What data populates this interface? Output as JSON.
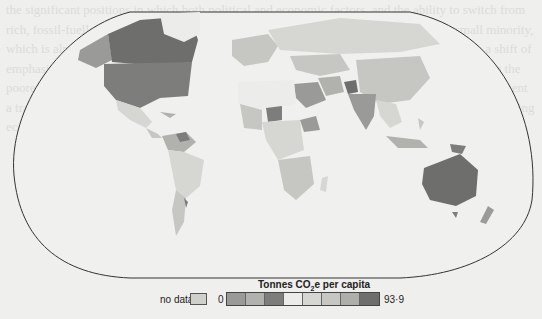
{
  "map": {
    "title": "Tonnes CO2e per capita",
    "title_main": "Tonnes CO",
    "title_sub": "2",
    "title_rest": "e per capita",
    "type": "choropleth world map",
    "projection": "pseudo-elliptical (Robinson-like) with flattened poles"
  },
  "legend": {
    "no_data_label": "no data",
    "no_data_color": "#cfcfcc",
    "min_label": "0",
    "max_label": "93·9",
    "swatches": [
      "#9a9a98",
      "#b1b1ae",
      "#7d7d7b",
      "#ececea",
      "#d6d6d3",
      "#c6c6c3",
      "#aeaeab",
      "#6e6e6c"
    ]
  },
  "regions": {
    "north_america": {
      "usa": "#7d7d7b",
      "canada": "#6e6e6c",
      "alaska": "#9a9a98",
      "mexico": "#d6d6d3",
      "greenland": "#ececea"
    },
    "south_america": {
      "north": "#b1b1ae",
      "venezuela": "#7d7d7b",
      "rest": "#d6d6d3"
    },
    "europe_russia": {
      "russia": "#d6d6d3",
      "europe": "#c6c6c3"
    },
    "middle_east": {
      "saudi": "#9a9a98",
      "iran": "#b1b1ae",
      "afghanistan": "#6e6e6c"
    },
    "africa": {
      "north": "#ececea",
      "sahel": "#c6c6c3",
      "niger_area": "#7d7d7b",
      "ethiopia": "#9a9a98",
      "south": "#d6d6d3",
      "zambia_area": "#6e6e6c"
    },
    "asia": {
      "china": "#c6c6c3",
      "india": "#9a9a98",
      "southeast": "#d6d6d3",
      "indonesia": "#b1b1ae"
    },
    "oceania": {
      "australia": "#6e6e6c",
      "new_zealand": "#9a9a98",
      "png": "#7d7d7b"
    }
  },
  "background_text": "the significant positions in which both political and economic factors, and the ability to switch from rich, fossil-fuelled, consumers to those that are poor and vulnerable to change. Only a small minority, which is already wealthy, have the ability to absorb the impact. Sustainable change requires a shift of emphasis away from the developed world toward a world that is more equitable, a world where the poorest nations are given the right to grow. The highest emissions at the end of the century represent a transition towards cleaner technologies while population growth and an emerging energy-producing economy force us to reduce emissions."
}
